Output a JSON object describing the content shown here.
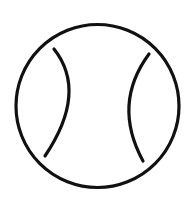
{
  "icon": {
    "name": "tennis-ball-icon",
    "stroke_color": "#111111",
    "background_color": "#ffffff",
    "stroke_width": 3.2,
    "ball": {
      "cx": 97.5,
      "cy": 106,
      "r": 81.5
    },
    "seams": [
      {
        "id": "left-seam",
        "d": "M 54 49 Q 88 92 45 156"
      },
      {
        "id": "right-seam",
        "d": "M 149 54 Q 112 104 143 161"
      }
    ]
  }
}
